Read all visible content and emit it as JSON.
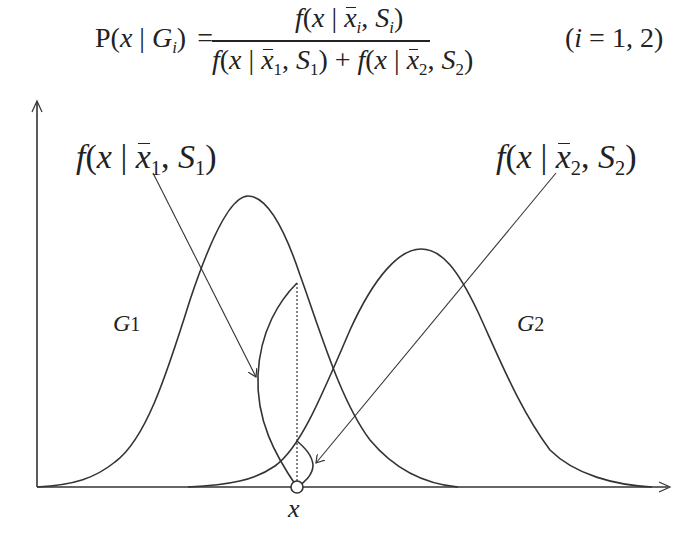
{
  "formula": {
    "lhs": {
      "prefix": "P(",
      "var": "x",
      "bar": " | ",
      "group": "G",
      "group_sub": "i",
      "suffix": ")"
    },
    "equals": "=",
    "numerator": {
      "f": "f",
      "open": "(",
      "x": "x",
      "bar": " | ",
      "mean": "x",
      "mean_sub": "i",
      "comma": ", ",
      "cov": "S",
      "cov_sub": "i",
      "close": ")"
    },
    "denominator": {
      "term1": {
        "f": "f",
        "open": "(",
        "x": "x",
        "bar": " | ",
        "mean": "x",
        "mean_sub": "1",
        "comma": ", ",
        "cov": "S",
        "cov_sub": "1",
        "close": ")"
      },
      "plus": " + ",
      "term2": {
        "f": "f",
        "open": "(",
        "x": "x",
        "bar": " | ",
        "mean": "x",
        "mean_sub": "2",
        "comma": ", ",
        "cov": "S",
        "cov_sub": "2",
        "close": ")"
      }
    },
    "condition": {
      "open": "(",
      "var": "i",
      "rest": " = 1, 2)"
    }
  },
  "diagram": {
    "label_f1": {
      "f": "f",
      "open": "(",
      "x": "x",
      "bar": " | ",
      "mean": "x",
      "mean_sub": "1",
      "comma": ", ",
      "cov": "S",
      "cov_sub": "1",
      "close": ")"
    },
    "label_f2": {
      "f": "f",
      "open": "(",
      "x": "x",
      "bar": " | ",
      "mean": "x",
      "mean_sub": "2",
      "comma": ", ",
      "cov": "S",
      "cov_sub": "2",
      "close": ")"
    },
    "group1": {
      "letter": "G",
      "sub": "1"
    },
    "group2": {
      "letter": "G",
      "sub": "2"
    },
    "x_marker_label": "x",
    "stroke_color": "#333333",
    "curves": [
      {
        "name": "G1",
        "peak_x": 248,
        "peak_y": 196,
        "start_x": 37,
        "end_x": 458
      },
      {
        "name": "G2",
        "peak_x": 421,
        "peak_y": 249,
        "start_x": 188,
        "end_x": 652
      }
    ],
    "x_position": 297
  }
}
